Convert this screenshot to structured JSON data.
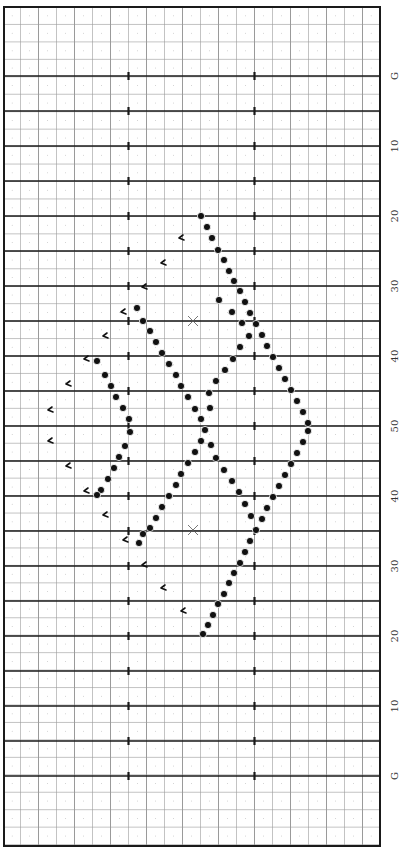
{
  "field": {
    "left": 4,
    "right": 380,
    "top": 7,
    "bottom": 846,
    "border_color": "#1a1a1a",
    "minor_grid_color": "#9a9a9a",
    "dot_grid_color": "#c8c8c8",
    "column_lines_x": [
      20.5,
      38.5,
      56.5,
      74.5,
      92.5,
      110.5,
      128.5,
      146.5,
      164.5,
      182.5,
      200.5,
      218.5,
      236.5,
      254.5,
      272.5,
      290.5,
      308.5,
      326.5,
      344.5,
      362.5
    ],
    "hash_marks_x": [
      128.5,
      254.5
    ],
    "minor_row_step": 17.45,
    "yard_lines": [
      {
        "y": 76,
        "label": "G"
      },
      {
        "y": 111,
        "label": ""
      },
      {
        "y": 146,
        "label": "10"
      },
      {
        "y": 181,
        "label": ""
      },
      {
        "y": 216,
        "label": "20"
      },
      {
        "y": 251,
        "label": ""
      },
      {
        "y": 286,
        "label": "30"
      },
      {
        "y": 321,
        "label": ""
      },
      {
        "y": 356,
        "label": "40"
      },
      {
        "y": 391,
        "label": ""
      },
      {
        "y": 426,
        "label": "50"
      },
      {
        "y": 461,
        "label": ""
      },
      {
        "y": 496,
        "label": "40"
      },
      {
        "y": 531,
        "label": ""
      },
      {
        "y": 566,
        "label": "30"
      },
      {
        "y": 601,
        "label": ""
      },
      {
        "y": 636,
        "label": "20"
      },
      {
        "y": 671,
        "label": ""
      },
      {
        "y": 706,
        "label": "10"
      },
      {
        "y": 741,
        "label": ""
      },
      {
        "y": 776,
        "label": "G"
      }
    ],
    "label_x": 394
  },
  "markers": {
    "x_marks": [
      {
        "x": 193,
        "y": 321
      },
      {
        "x": 193,
        "y": 530
      }
    ],
    "dots": [
      {
        "x": 201,
        "y": 216
      },
      {
        "x": 207,
        "y": 227
      },
      {
        "x": 212,
        "y": 238
      },
      {
        "x": 218,
        "y": 250
      },
      {
        "x": 224,
        "y": 260
      },
      {
        "x": 229,
        "y": 271
      },
      {
        "x": 234,
        "y": 281
      },
      {
        "x": 240,
        "y": 291
      },
      {
        "x": 245,
        "y": 302
      },
      {
        "x": 250,
        "y": 313
      },
      {
        "x": 256,
        "y": 324
      },
      {
        "x": 262,
        "y": 335
      },
      {
        "x": 267,
        "y": 346
      },
      {
        "x": 273,
        "y": 357
      },
      {
        "x": 279,
        "y": 368
      },
      {
        "x": 285,
        "y": 379
      },
      {
        "x": 291,
        "y": 390
      },
      {
        "x": 297,
        "y": 401
      },
      {
        "x": 303,
        "y": 412
      },
      {
        "x": 308,
        "y": 423
      },
      {
        "x": 308,
        "y": 431
      },
      {
        "x": 303,
        "y": 442
      },
      {
        "x": 297,
        "y": 453
      },
      {
        "x": 291,
        "y": 464
      },
      {
        "x": 285,
        "y": 475
      },
      {
        "x": 279,
        "y": 486
      },
      {
        "x": 273,
        "y": 497
      },
      {
        "x": 267,
        "y": 508
      },
      {
        "x": 262,
        "y": 519
      },
      {
        "x": 256,
        "y": 530
      },
      {
        "x": 250,
        "y": 541
      },
      {
        "x": 245,
        "y": 552
      },
      {
        "x": 240,
        "y": 563
      },
      {
        "x": 234,
        "y": 573
      },
      {
        "x": 229,
        "y": 583
      },
      {
        "x": 224,
        "y": 594
      },
      {
        "x": 218,
        "y": 604
      },
      {
        "x": 213,
        "y": 615
      },
      {
        "x": 208,
        "y": 625
      },
      {
        "x": 203,
        "y": 634
      },
      {
        "x": 137,
        "y": 308
      },
      {
        "x": 143,
        "y": 321
      },
      {
        "x": 150,
        "y": 331
      },
      {
        "x": 156,
        "y": 342
      },
      {
        "x": 162,
        "y": 353
      },
      {
        "x": 169,
        "y": 364
      },
      {
        "x": 176,
        "y": 375
      },
      {
        "x": 181,
        "y": 386
      },
      {
        "x": 188,
        "y": 397
      },
      {
        "x": 195,
        "y": 409
      },
      {
        "x": 201,
        "y": 419
      },
      {
        "x": 205,
        "y": 430
      },
      {
        "x": 201,
        "y": 441
      },
      {
        "x": 195,
        "y": 452
      },
      {
        "x": 188,
        "y": 463
      },
      {
        "x": 181,
        "y": 474
      },
      {
        "x": 176,
        "y": 485
      },
      {
        "x": 169,
        "y": 496
      },
      {
        "x": 162,
        "y": 507
      },
      {
        "x": 156,
        "y": 518
      },
      {
        "x": 150,
        "y": 528
      },
      {
        "x": 143,
        "y": 534
      },
      {
        "x": 139,
        "y": 543
      },
      {
        "x": 219,
        "y": 300
      },
      {
        "x": 232,
        "y": 312
      },
      {
        "x": 242,
        "y": 323
      },
      {
        "x": 249,
        "y": 336
      },
      {
        "x": 240,
        "y": 347
      },
      {
        "x": 233,
        "y": 359
      },
      {
        "x": 225,
        "y": 370
      },
      {
        "x": 216,
        "y": 381
      },
      {
        "x": 209,
        "y": 393
      },
      {
        "x": 210,
        "y": 408
      },
      {
        "x": 211,
        "y": 445
      },
      {
        "x": 216,
        "y": 458
      },
      {
        "x": 224,
        "y": 470
      },
      {
        "x": 232,
        "y": 481
      },
      {
        "x": 239,
        "y": 492
      },
      {
        "x": 245,
        "y": 504
      },
      {
        "x": 251,
        "y": 516
      },
      {
        "x": 97,
        "y": 361
      },
      {
        "x": 105,
        "y": 375
      },
      {
        "x": 111,
        "y": 386
      },
      {
        "x": 116,
        "y": 397
      },
      {
        "x": 123,
        "y": 408
      },
      {
        "x": 129,
        "y": 419
      },
      {
        "x": 130,
        "y": 432
      },
      {
        "x": 125,
        "y": 446
      },
      {
        "x": 119,
        "y": 457
      },
      {
        "x": 114,
        "y": 468
      },
      {
        "x": 108,
        "y": 479
      },
      {
        "x": 101,
        "y": 490
      },
      {
        "x": 97,
        "y": 495
      }
    ],
    "flags": [
      {
        "x": 181,
        "y": 238
      },
      {
        "x": 163,
        "y": 263
      },
      {
        "x": 144,
        "y": 287
      },
      {
        "x": 123,
        "y": 312
      },
      {
        "x": 105,
        "y": 336
      },
      {
        "x": 86,
        "y": 359
      },
      {
        "x": 68,
        "y": 384
      },
      {
        "x": 50,
        "y": 410
      },
      {
        "x": 50,
        "y": 441
      },
      {
        "x": 68,
        "y": 466
      },
      {
        "x": 86,
        "y": 491
      },
      {
        "x": 105,
        "y": 515
      },
      {
        "x": 125,
        "y": 540
      },
      {
        "x": 144,
        "y": 565
      },
      {
        "x": 163,
        "y": 588
      },
      {
        "x": 183,
        "y": 611
      }
    ]
  }
}
